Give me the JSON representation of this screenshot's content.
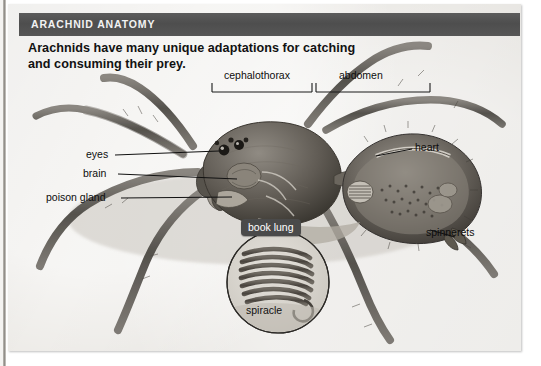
{
  "figure": {
    "header_title": "ARACHNID ANATOMY",
    "caption_line1": "Arachnids have many unique adaptations for catching",
    "caption_line2": "and consuming their prey.",
    "colors": {
      "header_bar": "#545454",
      "page_background": "#eceae6",
      "badge_background": "#4a4a4a",
      "label_text": "#0d0d0d"
    }
  },
  "brackets": [
    {
      "id": "cephalothorax",
      "label": "cephalothorax"
    },
    {
      "id": "abdomen",
      "label": "abdomen"
    }
  ],
  "callouts_left": [
    {
      "id": "eyes",
      "label": "eyes"
    },
    {
      "id": "brain",
      "label": "brain"
    },
    {
      "id": "poison-gland",
      "label": "poison gland"
    }
  ],
  "callouts_right": [
    {
      "id": "heart",
      "label": "heart"
    },
    {
      "id": "spinnerets",
      "label": "spinnerets"
    }
  ],
  "inset": {
    "badge_label": "book lung",
    "inner_label": "spiracle"
  }
}
